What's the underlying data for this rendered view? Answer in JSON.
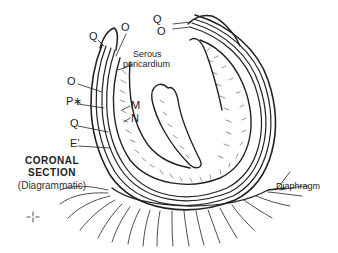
{
  "diagram": {
    "title_line1": "CORONAL",
    "title_line2": "SECTION",
    "subtitle": "(Diagrammatic)",
    "labels": {
      "q_top_left": "Q",
      "o_top_left": "O",
      "serous_1": "Serous",
      "serous_2": "pericardium",
      "q_top_right": "Q",
      "o_top_right": "O",
      "o_left": "O",
      "p_left": "P∗",
      "q_left": "Q",
      "e_left": "E’",
      "m": "M",
      "n": "N",
      "diaphragm": "Diaphragm"
    },
    "colors": {
      "ink": "#222222",
      "background": "#ffffff"
    }
  }
}
